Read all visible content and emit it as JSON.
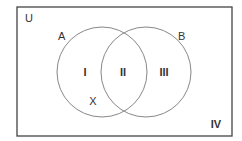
{
  "diagram": {
    "type": "venn",
    "universe_label": "U",
    "sets": [
      {
        "label": "A",
        "cx": 102,
        "cy": 72,
        "r": 45
      },
      {
        "label": "B",
        "cx": 146,
        "cy": 72,
        "r": 45
      }
    ],
    "regions": [
      {
        "label": "I",
        "meaning": "A only"
      },
      {
        "label": "II",
        "meaning": "A and B"
      },
      {
        "label": "III",
        "meaning": "B only"
      },
      {
        "label": "IV",
        "meaning": "neither A nor B"
      }
    ],
    "point_label": "X",
    "colors": {
      "stroke": "#888888",
      "border": "#444444",
      "text": "#333333",
      "background": "#ffffff"
    }
  }
}
